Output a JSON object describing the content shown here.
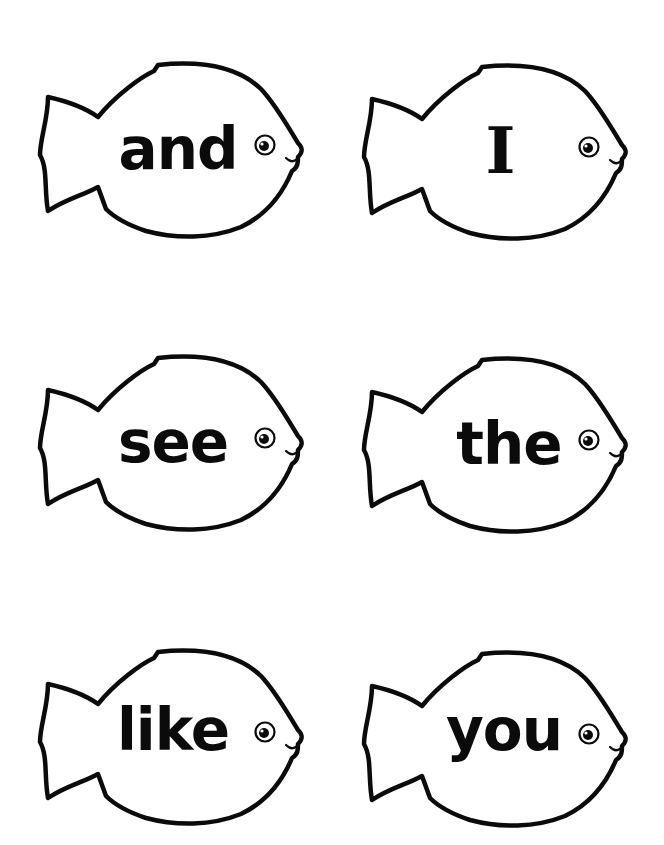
{
  "worksheet": {
    "title": "Sight word fish cards",
    "colors": {
      "background": "#ffffff",
      "outline": "#0b0b0b",
      "text": "#0b0b0b"
    },
    "cards": [
      {
        "word": "and",
        "row": 1,
        "column": 1,
        "icon": "fish-icon"
      },
      {
        "word": "I",
        "row": 1,
        "column": 2,
        "icon": "fish-icon"
      },
      {
        "word": "see",
        "row": 2,
        "column": 1,
        "icon": "fish-icon"
      },
      {
        "word": "the",
        "row": 2,
        "column": 2,
        "icon": "fish-icon"
      },
      {
        "word": "like",
        "row": 3,
        "column": 1,
        "icon": "fish-icon"
      },
      {
        "word": "you",
        "row": 3,
        "column": 2,
        "icon": "fish-icon"
      }
    ]
  }
}
